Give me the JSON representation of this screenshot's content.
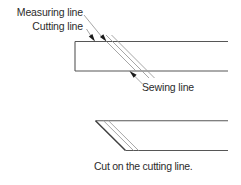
{
  "colors": {
    "bg": "#ffffff",
    "edge": "#565656",
    "cut": "#3f3f3f",
    "thin": "#9c9c9c",
    "arrow": "#1b1b1b",
    "text": "#2b2b2b"
  },
  "labels": {
    "measuring": "Measuring line",
    "cutting": "Cutting line",
    "sewing": "Sewing line",
    "caption": "Cut on the cutting line."
  },
  "figure": {
    "segments": [
      {
        "name": "strip-top-edge",
        "kind": "edge",
        "x1": 75,
        "y1": 41.5,
        "x2": 228,
        "y2": 41.5
      },
      {
        "name": "strip-bottom-edge",
        "kind": "edge",
        "x1": 75,
        "y1": 71,
        "x2": 228,
        "y2": 71
      },
      {
        "name": "strip-left-edge",
        "kind": "edge",
        "x1": 75,
        "y1": 41.5,
        "x2": 75,
        "y2": 71
      },
      {
        "name": "measuring-leader-line",
        "kind": "thin",
        "x1": 84,
        "y1": 15,
        "x2": 104,
        "y2": 39.5
      },
      {
        "name": "cutting-leader-line",
        "kind": "thin",
        "x1": 86.5,
        "y1": 29,
        "x2": 93.5,
        "y2": 39.8
      },
      {
        "name": "measuring-line-on-fabric",
        "kind": "thin",
        "x1": 106.5,
        "y1": 41.5,
        "x2": 136,
        "y2": 71
      },
      {
        "name": "cutting-line-on-fabric",
        "kind": "thin",
        "x1": 106,
        "y1": 35,
        "x2": 149,
        "y2": 78
      },
      {
        "name": "sewing-line-on-fabric",
        "kind": "thin",
        "x1": 111.5,
        "y1": 35,
        "x2": 154.5,
        "y2": 78
      },
      {
        "name": "sewing-leader-line",
        "kind": "thin",
        "x1": 131,
        "y1": 72.5,
        "x2": 142.5,
        "y2": 84
      },
      {
        "name": "cut-strip-top-edge",
        "kind": "edge",
        "x1": 95.5,
        "y1": 120.7,
        "x2": 228,
        "y2": 120.7
      },
      {
        "name": "cut-strip-cut-edge",
        "kind": "cut",
        "x1": 95.5,
        "y1": 120.7,
        "x2": 125.5,
        "y2": 150.5
      },
      {
        "name": "cut-strip-bottom-edge",
        "kind": "edge",
        "x1": 125.5,
        "y1": 150.5,
        "x2": 228,
        "y2": 150.5
      },
      {
        "name": "cut-strip-line-1",
        "kind": "thin",
        "x1": 103.5,
        "y1": 120.7,
        "x2": 133.5,
        "y2": 150.5
      },
      {
        "name": "cut-strip-line-2",
        "kind": "thin",
        "x1": 108.5,
        "y1": 120.7,
        "x2": 138.5,
        "y2": 150.5
      }
    ],
    "arrows": [
      {
        "name": "cutting-line-arrowhead",
        "tip_x": 95,
        "tip_y": 41.5,
        "angle": 55
      },
      {
        "name": "measuring-line-arrowhead",
        "tip_x": 106.5,
        "tip_y": 41.5,
        "angle": 51
      },
      {
        "name": "sewing-line-arrowhead",
        "tip_x": 129.5,
        "tip_y": 71,
        "angle": 223
      }
    ]
  }
}
